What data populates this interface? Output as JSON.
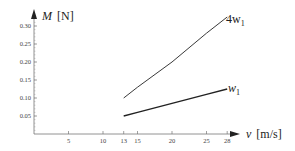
{
  "chart_data": {
    "type": "line",
    "title": "",
    "xlabel": "v [m/s]",
    "ylabel": "M [N]",
    "xlim": [
      0,
      29
    ],
    "ylim": [
      0,
      0.32
    ],
    "grid": false,
    "legend": "inline labels at line ends",
    "x_ticks": [
      5,
      10,
      13,
      15,
      20,
      25,
      28
    ],
    "y_ticks": [
      0.05,
      0.1,
      0.15,
      0.2,
      0.25,
      0.3
    ],
    "y_tick_labels": [
      "0.05",
      "0.10",
      "0.15",
      "0.20",
      "0.25",
      "0.30"
    ],
    "series": [
      {
        "name": "4w1",
        "label_main": "4w",
        "label_sub": "1",
        "x": [
          13,
          15,
          20,
          25,
          28
        ],
        "values": [
          0.1,
          0.13,
          0.2,
          0.28,
          0.325
        ]
      },
      {
        "name": "w1",
        "label_main": "w",
        "label_sub": "1",
        "x": [
          13,
          15,
          20,
          25,
          28
        ],
        "values": [
          0.05,
          0.06,
          0.085,
          0.11,
          0.125
        ]
      }
    ]
  },
  "axes": {
    "x_title_var": "v",
    "x_title_unit": "[m/s]",
    "y_title_var": "M",
    "y_title_unit": "[N]"
  }
}
